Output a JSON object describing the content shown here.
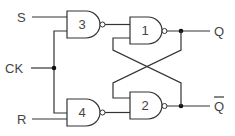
{
  "diagram": {
    "type": "clocked SR flip-flop (NAND)",
    "inputs": {
      "s": "S",
      "ck": "CK",
      "r": "R"
    },
    "outputs": {
      "q": "Q",
      "qbar": "Q"
    },
    "gates": [
      {
        "id": "3",
        "label": "3",
        "kind": "NAND",
        "inputs": [
          "S",
          "CK"
        ]
      },
      {
        "id": "4",
        "label": "4",
        "kind": "NAND",
        "inputs": [
          "CK",
          "R"
        ]
      },
      {
        "id": "1",
        "label": "1",
        "kind": "NAND",
        "inputs": [
          "gate3",
          "Q-bar feedback"
        ]
      },
      {
        "id": "2",
        "label": "2",
        "kind": "NAND",
        "inputs": [
          "Q feedback",
          "gate4"
        ]
      }
    ],
    "colors": {
      "line": "#333333",
      "text": "#444444",
      "background": "#ffffff"
    }
  }
}
